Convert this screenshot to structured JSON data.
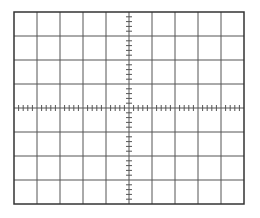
{
  "graticule": {
    "title": "Oscilloscope graticule",
    "x": 14,
    "y": 12,
    "width": 230,
    "height": 192,
    "columns": 10,
    "rows": 8,
    "minor_ticks_per_division": 5,
    "tick_length": 6,
    "line_color": "#555555",
    "border_color": "#333333",
    "background": "#ffffff"
  }
}
